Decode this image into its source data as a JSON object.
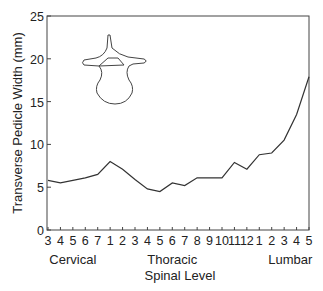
{
  "chart_data": {
    "type": "line",
    "title": "",
    "xlabel": "Spinal Level",
    "ylabel": "Transverse Pedicle Width (mm)",
    "ylim": [
      0,
      25
    ],
    "yticks": [
      0,
      5,
      10,
      15,
      20,
      25
    ],
    "grid": false,
    "legend": null,
    "categories": [
      "3",
      "4",
      "5",
      "6",
      "7",
      "1",
      "2",
      "3",
      "4",
      "5",
      "6",
      "7",
      "8",
      "9",
      "10",
      "11",
      "12",
      "1",
      "2",
      "3",
      "4",
      "5"
    ],
    "category_full": [
      "C3",
      "C4",
      "C5",
      "C6",
      "C7",
      "T1",
      "T2",
      "T3",
      "T4",
      "T5",
      "T6",
      "T7",
      "T8",
      "T9",
      "T10",
      "T11",
      "T12",
      "L1",
      "L2",
      "L3",
      "L4",
      "L5"
    ],
    "region_labels": [
      {
        "label": "Cervical",
        "x_index": 2
      },
      {
        "label": "Thoracic",
        "x_index": 10
      },
      {
        "label": "Lumbar",
        "x_index": 19.5
      }
    ],
    "series": [
      {
        "name": "Transverse Pedicle Width",
        "values": [
          5.8,
          5.5,
          5.8,
          6.1,
          6.5,
          8.0,
          7.1,
          5.9,
          4.8,
          4.5,
          5.5,
          5.2,
          6.1,
          6.1,
          6.1,
          7.9,
          7.1,
          8.8,
          9.0,
          10.5,
          13.5,
          17.9
        ]
      }
    ],
    "annotations": [
      "vertebra-illustration (axial view)"
    ],
    "colors": {
      "line": "#333333",
      "axis": "#444444",
      "text": "#222222"
    }
  }
}
